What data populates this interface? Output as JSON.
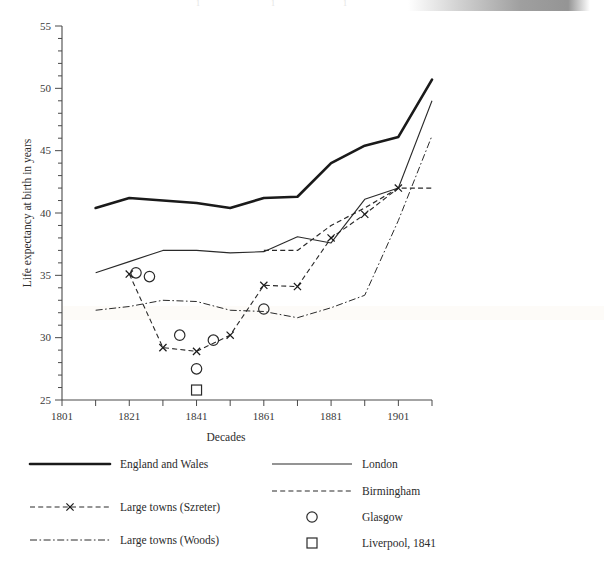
{
  "figure": {
    "background_color": "#ffffff",
    "ink_color": "#2b2b2b",
    "top_ghost_marks": [
      "1",
      "1",
      "1"
    ],
    "top_gradient_bar": true
  },
  "chart_data": {
    "type": "line",
    "title": "",
    "xlabel": "Decades",
    "ylabel": "Life expectancy at birth in years",
    "xlim": [
      1801,
      1911
    ],
    "ylim": [
      25,
      55
    ],
    "x_major_ticks": [
      1801,
      1821,
      1841,
      1861,
      1881,
      1901
    ],
    "x_minor_ticks": [
      1811,
      1831,
      1851,
      1871,
      1891,
      1911
    ],
    "x_tick_labels": [
      "1801",
      "1821",
      "1841",
      "1861",
      "1881",
      "1901"
    ],
    "y_major_ticks": [
      25,
      30,
      35,
      40,
      45,
      50,
      55
    ],
    "y_tick_labels": [
      "25",
      "30",
      "35",
      "40",
      "45",
      "50",
      "55"
    ],
    "y_minor_tick_step": 1,
    "grid": false,
    "legend_position": "below-plot",
    "series": [
      {
        "name": "England and Wales",
        "style": "solid-thick",
        "color": "#1a1a1a",
        "x": [
          1811,
          1821,
          1831,
          1841,
          1851,
          1861,
          1871,
          1881,
          1891,
          1901,
          1911
        ],
        "values": [
          40.4,
          41.2,
          41.0,
          40.8,
          40.4,
          41.2,
          41.3,
          44.0,
          45.4,
          46.1,
          50.7
        ]
      },
      {
        "name": "London",
        "style": "solid-thin",
        "color": "#2a2a2a",
        "x": [
          1811,
          1821,
          1831,
          1841,
          1851,
          1861,
          1871,
          1881,
          1891,
          1901,
          1911
        ],
        "values": [
          35.2,
          36.1,
          37.0,
          37.0,
          36.8,
          36.9,
          38.1,
          37.6,
          41.1,
          42.0,
          49.0
        ]
      },
      {
        "name": "Birmingham",
        "style": "dashed",
        "color": "#2a2a2a",
        "x": [
          1861,
          1871,
          1881,
          1891,
          1901,
          1911
        ],
        "values": [
          37.0,
          37.0,
          39.0,
          40.4,
          42.0,
          42.0
        ]
      },
      {
        "name": "Large towns (Szreter)",
        "style": "dashed-x",
        "color": "#2a2a2a",
        "marker": "x",
        "x": [
          1821,
          1831,
          1841,
          1851,
          1861,
          1871,
          1881,
          1891,
          1901
        ],
        "values": [
          35.1,
          29.2,
          28.9,
          30.2,
          34.2,
          34.1,
          38.0,
          39.9,
          42.0
        ]
      },
      {
        "name": "Large towns (Woods)",
        "style": "dash-dot",
        "color": "#2a2a2a",
        "x": [
          1811,
          1821,
          1831,
          1841,
          1851,
          1861,
          1871,
          1881,
          1891,
          1901,
          1911
        ],
        "values": [
          32.2,
          32.5,
          33.0,
          32.9,
          32.2,
          32.1,
          31.6,
          32.4,
          33.4,
          39.4,
          46.2
        ]
      },
      {
        "name": "Glasgow",
        "style": "markers-only",
        "marker": "circle",
        "color": "#2a2a2a",
        "x": [
          1823,
          1827,
          1836,
          1841,
          1846,
          1861
        ],
        "values": [
          35.2,
          34.9,
          30.2,
          27.5,
          29.8,
          32.3
        ]
      },
      {
        "name": "Liverpool, 1841",
        "style": "markers-only",
        "marker": "square",
        "color": "#2a2a2a",
        "x": [
          1841
        ],
        "values": [
          25.8
        ]
      }
    ]
  },
  "legend": {
    "entries": [
      {
        "label": "England and Wales",
        "style": "solid-thick",
        "column": "left"
      },
      {
        "label": "London",
        "style": "solid-thin",
        "column": "right"
      },
      {
        "label": "Birmingham",
        "style": "dashed",
        "column": "right"
      },
      {
        "label": "Large towns (Szreter)",
        "style": "dashed-x",
        "column": "left"
      },
      {
        "label": "Glasgow",
        "style": "circle-marker",
        "column": "right"
      },
      {
        "label": "Large towns (Woods)",
        "style": "dash-dot",
        "column": "left"
      },
      {
        "label": "Liverpool, 1841",
        "style": "square-marker",
        "column": "right"
      }
    ]
  }
}
